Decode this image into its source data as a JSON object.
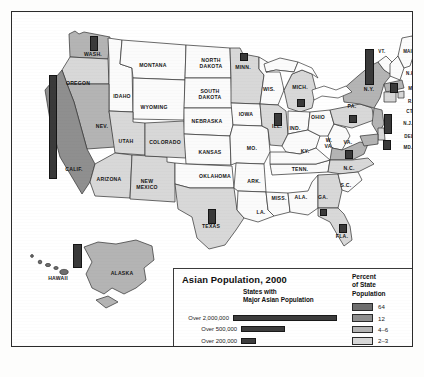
{
  "figure": {
    "kind": "thematic-choropleth-map",
    "region": "United States"
  },
  "legend": {
    "title": "Asian Population, 2000",
    "subtitle": "States with\nMajor Asian Population",
    "population_classes": [
      {
        "label": "Over 2,000,000",
        "bar_width_px": 120,
        "color": "#3d3d3d"
      },
      {
        "label": "Over 500,000",
        "bar_width_px": 44,
        "color": "#3d3d3d"
      },
      {
        "label": "Over 200,000",
        "bar_width_px": 15,
        "color": "#3d3d3d"
      },
      {
        "label": "Over 100,000",
        "bar_width_px": 7,
        "color": "#2e2e2e"
      }
    ],
    "percent": {
      "title": "Percent\nof State\nPopulation",
      "classes": [
        {
          "label": "64",
          "color": "#6e6e6e"
        },
        {
          "label": "12",
          "color": "#8f8f8f"
        },
        {
          "label": "4–6",
          "color": "#b4b4b4"
        },
        {
          "label": "2–3",
          "color": "#d8d8d8"
        },
        {
          "label": "Less than 2",
          "color": "#fbfbfb"
        }
      ]
    }
  },
  "map_labels": [
    {
      "name": "WASH.",
      "x": 81,
      "y": 43,
      "size": "n"
    },
    {
      "name": "OREGON",
      "x": 66,
      "y": 72,
      "size": "n"
    },
    {
      "name": "IDAHO",
      "x": 110,
      "y": 85,
      "size": "n"
    },
    {
      "name": "MONTANA",
      "x": 141,
      "y": 54,
      "size": "n"
    },
    {
      "name": "WYOMING",
      "x": 142,
      "y": 96,
      "size": "n"
    },
    {
      "name": "NEV.",
      "x": 90,
      "y": 115,
      "size": "n"
    },
    {
      "name": "UTAH",
      "x": 114,
      "y": 130,
      "size": "n"
    },
    {
      "name": "CALIF.",
      "x": 62,
      "y": 158,
      "size": "n"
    },
    {
      "name": "ARIZONA",
      "x": 97,
      "y": 168,
      "size": "n"
    },
    {
      "name": "NEW\nMEXICO",
      "x": 135,
      "y": 173,
      "size": "n"
    },
    {
      "name": "COLORADO",
      "x": 153,
      "y": 131,
      "size": "n"
    },
    {
      "name": "NORTH\nDAKOTA",
      "x": 199,
      "y": 52,
      "size": "n"
    },
    {
      "name": "SOUTH\nDAKOTA",
      "x": 198,
      "y": 83,
      "size": "n"
    },
    {
      "name": "NEBRASKA",
      "x": 195,
      "y": 110,
      "size": "n"
    },
    {
      "name": "KANSAS",
      "x": 198,
      "y": 141,
      "size": "n"
    },
    {
      "name": "OKLAHOMA",
      "x": 203,
      "y": 165,
      "size": "n"
    },
    {
      "name": "TEXAS",
      "x": 199,
      "y": 215,
      "size": "n"
    },
    {
      "name": "MINN.",
      "x": 231,
      "y": 56,
      "size": "n"
    },
    {
      "name": "IOWA",
      "x": 234,
      "y": 103,
      "size": "n"
    },
    {
      "name": "MO.",
      "x": 240,
      "y": 137,
      "size": "n"
    },
    {
      "name": "ARK.",
      "x": 242,
      "y": 170,
      "size": "n"
    },
    {
      "name": "LA.",
      "x": 249,
      "y": 201,
      "size": "n"
    },
    {
      "name": "WIS.",
      "x": 257,
      "y": 78,
      "size": "n"
    },
    {
      "name": "ILL.",
      "x": 265,
      "y": 115,
      "size": "n"
    },
    {
      "name": "MISS.",
      "x": 267,
      "y": 187,
      "size": "n"
    },
    {
      "name": "MICH.",
      "x": 288,
      "y": 76,
      "size": "n"
    },
    {
      "name": "IND.",
      "x": 283,
      "y": 117,
      "size": "n"
    },
    {
      "name": "KY.",
      "x": 293,
      "y": 140,
      "size": "n"
    },
    {
      "name": "TENN.",
      "x": 288,
      "y": 158,
      "size": "n"
    },
    {
      "name": "ALA.",
      "x": 289,
      "y": 186,
      "size": "n"
    },
    {
      "name": "GA.",
      "x": 311,
      "y": 186,
      "size": "n"
    },
    {
      "name": "FLA.",
      "x": 330,
      "y": 225,
      "size": "n"
    },
    {
      "name": "OHIO",
      "x": 306,
      "y": 106,
      "size": "n"
    },
    {
      "name": "W.\nVA.",
      "x": 317,
      "y": 132,
      "size": "n"
    },
    {
      "name": "VA.",
      "x": 336,
      "y": 131,
      "size": "n"
    },
    {
      "name": "N.C.",
      "x": 337,
      "y": 157,
      "size": "n"
    },
    {
      "name": "S.C.",
      "x": 334,
      "y": 174,
      "size": "n"
    },
    {
      "name": "PA.",
      "x": 340,
      "y": 95,
      "size": "n"
    },
    {
      "name": "N.Y.",
      "x": 357,
      "y": 78,
      "size": "n"
    },
    {
      "name": "VT.",
      "x": 370,
      "y": 40,
      "size": "sm"
    },
    {
      "name": "MAINE",
      "x": 399,
      "y": 40,
      "size": "sm"
    },
    {
      "name": "N.H.",
      "x": 399,
      "y": 62,
      "size": "sm"
    },
    {
      "name": "MASS.",
      "x": 404,
      "y": 77,
      "size": "sm"
    },
    {
      "name": "R.I.",
      "x": 400,
      "y": 90,
      "size": "sm"
    },
    {
      "name": "CT.",
      "x": 398,
      "y": 100,
      "size": "sm"
    },
    {
      "name": "N.J.",
      "x": 396,
      "y": 112,
      "size": "sm"
    },
    {
      "name": "DEL.",
      "x": 398,
      "y": 125,
      "size": "sm"
    },
    {
      "name": "MD.",
      "x": 396,
      "y": 136,
      "size": "sm"
    },
    {
      "name": "ALASKA",
      "x": 110,
      "y": 262,
      "size": "n"
    },
    {
      "name": "HAWAII",
      "x": 46,
      "y": 267,
      "size": "n"
    }
  ],
  "map_bars": [
    {
      "state": "WASH.",
      "x": 78,
      "y": 24,
      "w": 8,
      "h": 15,
      "class": "Over 200,000"
    },
    {
      "state": "CALIF.",
      "x": 37,
      "y": 63,
      "w": 8,
      "h": 104,
      "class": "Over 2,000,000"
    },
    {
      "state": "TEXAS",
      "x": 196,
      "y": 197,
      "w": 8,
      "h": 15,
      "class": "Over 200,000"
    },
    {
      "state": "MINN.",
      "x": 228,
      "y": 41,
      "w": 8,
      "h": 8,
      "class": "Over 100,000"
    },
    {
      "state": "ILL.",
      "x": 262,
      "y": 101,
      "w": 8,
      "h": 13,
      "class": "Over 200,000"
    },
    {
      "state": "MICH.",
      "x": 285,
      "y": 87,
      "w": 8,
      "h": 8,
      "class": "Over 100,000"
    },
    {
      "state": "N.Y.",
      "x": 353,
      "y": 37,
      "w": 9,
      "h": 36,
      "class": "Over 2,000,000"
    },
    {
      "state": "MASS.",
      "x": 378,
      "y": 71,
      "w": 8,
      "h": 10,
      "class": "Over 200,000"
    },
    {
      "state": "N.J.",
      "x": 372,
      "y": 102,
      "w": 8,
      "h": 20,
      "class": "Over 500,000"
    },
    {
      "state": "PA.",
      "x": 337,
      "y": 103,
      "w": 8,
      "h": 8,
      "class": "Over 100,000"
    },
    {
      "state": "VA.",
      "x": 333,
      "y": 138,
      "w": 8,
      "h": 9,
      "class": "Over 100,000"
    },
    {
      "state": "MD.",
      "x": 371,
      "y": 128,
      "w": 8,
      "h": 10,
      "class": "Over 100,000"
    },
    {
      "state": "FLA.",
      "x": 327,
      "y": 212,
      "w": 8,
      "h": 9,
      "class": "Over 200,000"
    },
    {
      "state": "GA.",
      "x": 308,
      "y": 197,
      "w": 7,
      "h": 7,
      "class": "Over 100,000"
    },
    {
      "state": "HAWAII",
      "x": 61,
      "y": 232,
      "w": 9,
      "h": 24,
      "class": "Over 500,000"
    }
  ],
  "state_shading": {
    "HAWAII": "64",
    "CALIF.": "12",
    "WASH.": "4–6",
    "NEV.": "4–6",
    "N.Y.": "4–6",
    "N.J.": "4–6",
    "ALASKA": "4–6",
    "MASS.": "4–6",
    "VA.": "4–6",
    "MD.": "4–6",
    "OREGON": "2–3",
    "ILL.": "2–3",
    "TEXAS": "2–3",
    "MINN.": "2–3",
    "COLORADO": "2–3",
    "UTAH": "2–3",
    "ARIZONA": "2–3",
    "NEW MEXICO": "2–3",
    "MICH.": "2–3",
    "GA.": "2–3",
    "FLA.": "2–3",
    "PA.": "2–3",
    "CT.": "2–3",
    "R.I.": "2–3",
    "DEL.": "2–3",
    "others": "Less than 2"
  }
}
